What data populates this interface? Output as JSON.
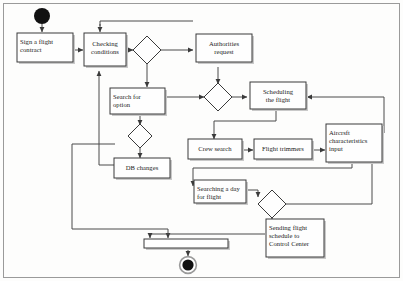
{
  "diagram": {
    "type": "uml-activity-diagram",
    "colors": {
      "node_fill": "#fefefe",
      "node_stroke": "#3a3a3a",
      "flow_stroke": "#4a4a4a",
      "shadow": "#c9c9c9",
      "frame": "#9a9a9a",
      "start_end": "#111111",
      "background": "#fdfdfc"
    },
    "nodes": [
      {
        "id": "start",
        "kind": "initial-node",
        "label": ""
      },
      {
        "id": "sign_contract",
        "kind": "activity",
        "label": "Sign a flight contract"
      },
      {
        "id": "checking",
        "kind": "activity",
        "label": "Checking conditions"
      },
      {
        "id": "decision1",
        "kind": "decision",
        "label": ""
      },
      {
        "id": "authorities",
        "kind": "activity",
        "label": "Authorities request"
      },
      {
        "id": "decision2",
        "kind": "decision",
        "label": ""
      },
      {
        "id": "scheduling",
        "kind": "activity",
        "label": "Scheduling the flight"
      },
      {
        "id": "search_option",
        "kind": "activity",
        "label": "Search for option"
      },
      {
        "id": "decision3",
        "kind": "decision",
        "label": ""
      },
      {
        "id": "db_changes",
        "kind": "activity",
        "label": "DB changes"
      },
      {
        "id": "crew_search",
        "kind": "activity",
        "label": "Crew search"
      },
      {
        "id": "flight_trimmers",
        "kind": "activity",
        "label": "Flight trimmers"
      },
      {
        "id": "aircraft_input",
        "kind": "activity",
        "label": "Aircraft characteristics input"
      },
      {
        "id": "searching_day",
        "kind": "activity",
        "label": "Searching a day for flight"
      },
      {
        "id": "decision4",
        "kind": "decision",
        "label": ""
      },
      {
        "id": "sending_schedule",
        "kind": "activity",
        "label": "Sending flight schedule to Control Center"
      },
      {
        "id": "join_bar",
        "kind": "join-bar",
        "label": ""
      },
      {
        "id": "end",
        "kind": "final-node",
        "label": ""
      }
    ],
    "labels": {
      "sign_contract": "Sign a flight\ncontract",
      "checking": "Checking\nconditions",
      "authorities": "Authorities\nrequest",
      "scheduling": "Scheduling\nthe flight",
      "search_option": "Search for\noption",
      "db_changes": "DB changes",
      "crew_search": "Crew search",
      "flight_trimmers": "Flight trimmers",
      "aircraft_input": "Aircrsft\ncharacteristics\ninput",
      "searching_day": "Searching a day\nfor flight",
      "sending_schedule": "Sending flight\nschedule to\nControl Center"
    },
    "edges": [
      {
        "from": "start",
        "to": "sign_contract"
      },
      {
        "from": "sign_contract",
        "to": "checking"
      },
      {
        "from": "checking",
        "to": "decision1"
      },
      {
        "from": "decision1",
        "to": "authorities"
      },
      {
        "from": "decision1",
        "to": "search_option"
      },
      {
        "from": "authorities",
        "to": "decision2"
      },
      {
        "from": "decision2",
        "to": "scheduling"
      },
      {
        "from": "search_option",
        "to": "decision3"
      },
      {
        "from": "search_option",
        "to": "decision2"
      },
      {
        "from": "decision3",
        "to": "db_changes"
      },
      {
        "from": "db_changes",
        "to": "checking"
      },
      {
        "from": "db_changes",
        "to": "join_bar"
      },
      {
        "from": "scheduling",
        "to": "crew_search"
      },
      {
        "from": "crew_search",
        "to": "flight_trimmers"
      },
      {
        "from": "flight_trimmers",
        "to": "aircraft_input"
      },
      {
        "from": "aircraft_input",
        "to": "scheduling"
      },
      {
        "from": "aircraft_input",
        "to": "searching_day"
      },
      {
        "from": "searching_day",
        "to": "decision4"
      },
      {
        "from": "decision4",
        "to": "sending_schedule"
      },
      {
        "from": "decision4",
        "to": "scheduling"
      },
      {
        "from": "sending_schedule",
        "to": "join_bar"
      },
      {
        "from": "join_bar",
        "to": "end"
      }
    ]
  }
}
